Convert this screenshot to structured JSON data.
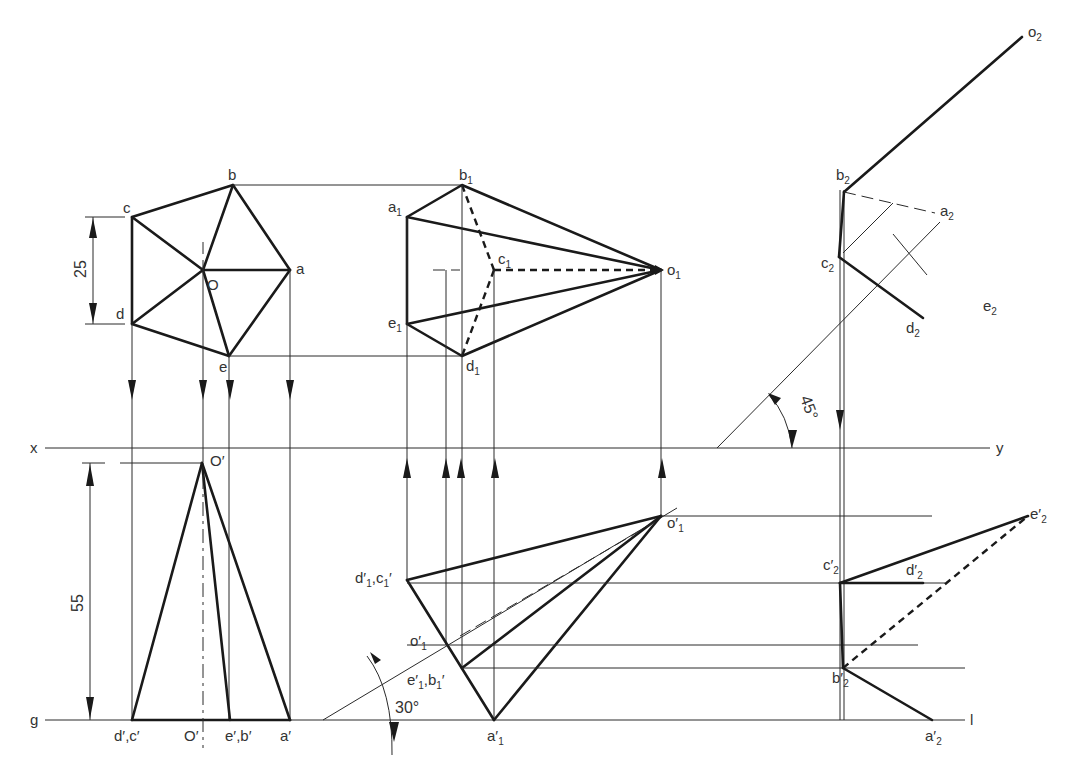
{
  "figure": {
    "reference_lines": {
      "xy": {
        "left": "x",
        "right": "y"
      },
      "gl": {
        "left": "g",
        "right": "l"
      }
    },
    "dimensions": {
      "top_side": "25",
      "height": "55",
      "angle_30": "30°",
      "angle_45": "45°"
    },
    "top_view": {
      "a": "a",
      "b": "b",
      "c": "c",
      "d": "d",
      "e": "e",
      "o": "O"
    },
    "front_view": {
      "apex": "O′",
      "base": [
        "d′,c′",
        "O′",
        "e′,b′",
        "a′"
      ]
    },
    "tilted_top_view": {
      "a": "a",
      "b": "b",
      "c": "c",
      "d": "d",
      "e": "e",
      "o": "o",
      "sub": "1"
    },
    "tilted_front_view": {
      "apex": "o′",
      "dc": "d′",
      "dc2": ",c",
      "eb": "e′",
      "eb2": ",b",
      "a": "a′",
      "o_mid": "o′",
      "sub": "1",
      "prime": "′"
    },
    "aux_top_view": {
      "o": "o",
      "b": "b",
      "a": "a",
      "c": "c",
      "d": "d",
      "e": "e",
      "sub": "2"
    },
    "aux_front_view": {
      "e": "e′",
      "c": "c′",
      "d": "d′",
      "b": "b′",
      "a": "a′",
      "sub": "2"
    }
  }
}
